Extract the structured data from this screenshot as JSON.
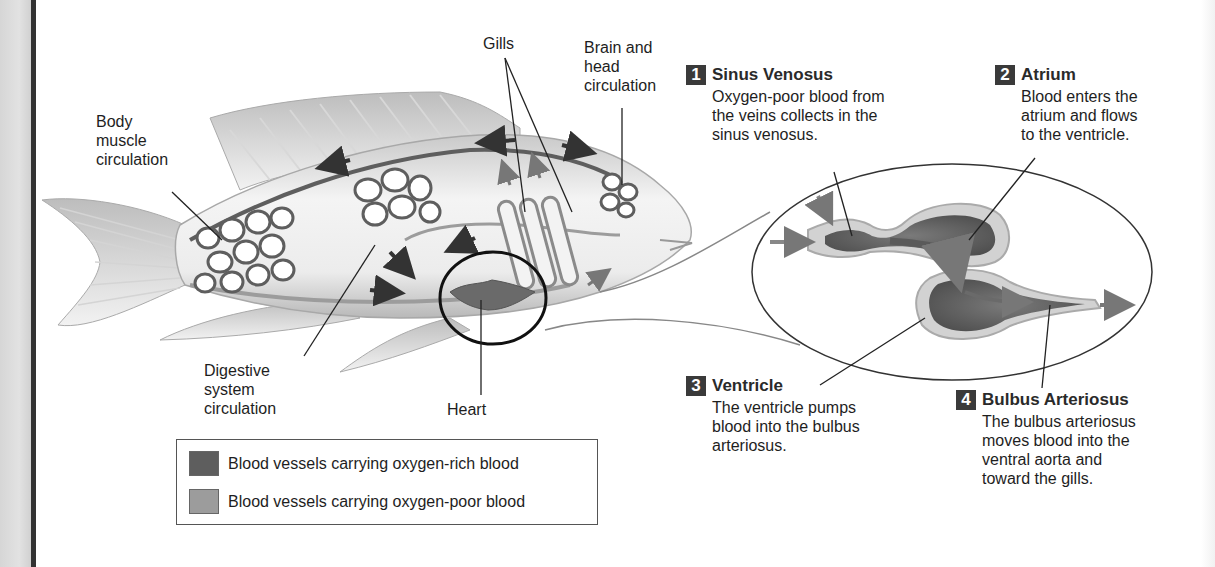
{
  "figure": {
    "labels": {
      "body_muscle": "Body\nmuscle\ncirculation",
      "gills": "Gills",
      "brain_head": "Brain and\nhead\ncirculation",
      "digestive": "Digestive\nsystem\ncirculation",
      "heart": "Heart"
    },
    "heart_steps": [
      {
        "number": "1",
        "title": "Sinus Venosus",
        "text": "Oxygen-poor blood from\nthe veins collects in the\nsinus venosus."
      },
      {
        "number": "2",
        "title": "Atrium",
        "text": "Blood enters the\natrium and flows\nto the ventricle."
      },
      {
        "number": "3",
        "title": "Ventricle",
        "text": "The ventricle pumps\nblood into the bulbus\narteriosus."
      },
      {
        "number": "4",
        "title": "Bulbus Arteriosus",
        "text": "The bulbus arteriosus\nmoves blood into the\nventral aorta and\ntoward the gills."
      }
    ],
    "legend": [
      {
        "label": "Blood vessels carrying oxygen-rich blood",
        "color": "#5e5e5e"
      },
      {
        "label": "Blood vessels carrying oxygen-poor blood",
        "color": "#9c9c9c"
      }
    ]
  }
}
